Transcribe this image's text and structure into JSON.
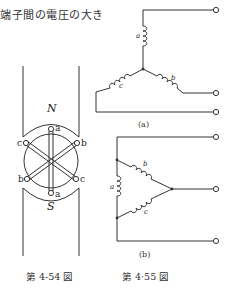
{
  "header": {
    "text": "端子間の電圧の大き"
  },
  "figure_4_54": {
    "caption": "第 4-54 図",
    "pole_top": "N",
    "pole_bottom": "S",
    "terminals": [
      "a",
      "b",
      "c",
      "b",
      "c",
      "a"
    ]
  },
  "figure_4_55": {
    "caption": "第 4·55 図",
    "subfig_a": {
      "label": "(a)",
      "coils": [
        "a",
        "b",
        "c"
      ],
      "connection": "star"
    },
    "subfig_b": {
      "label": "(b)",
      "coils": [
        "a",
        "b",
        "c"
      ],
      "connection": "delta"
    }
  },
  "colors": {
    "line": "#333333",
    "background": "#ffffff"
  }
}
